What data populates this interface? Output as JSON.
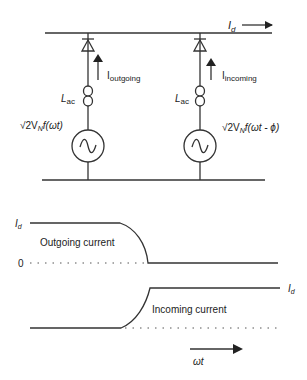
{
  "circuit": {
    "dc_current_label": "I",
    "dc_current_sub": "d",
    "left_branch": {
      "current_label": "I",
      "current_sub": "outgoing",
      "inductor_label": "L",
      "inductor_sub": "ac",
      "source_prefix": "√2V",
      "source_sub": "N",
      "source_func": "f(ωt)"
    },
    "right_branch": {
      "current_label": "I",
      "current_sub": "incoming",
      "inductor_label": "L",
      "inductor_sub": "ac",
      "source_prefix": "√2V",
      "source_sub": "N",
      "source_func": "f(ωt - ϕ)"
    }
  },
  "waveforms": {
    "outgoing": {
      "level_label": "I",
      "level_sub": "d",
      "zero_label": "0",
      "caption": "Outgoing current"
    },
    "incoming": {
      "level_label": "I",
      "level_sub": "d",
      "caption": "Incoming current"
    },
    "axis_label": "ωt"
  }
}
